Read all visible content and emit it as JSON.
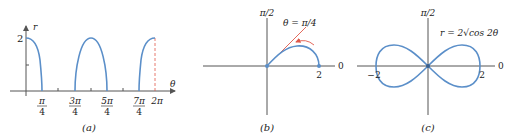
{
  "colors": {
    "curve": "#5b8fc9",
    "axis": "#555555",
    "accent": "#e0584a",
    "text": "#222222"
  },
  "panel_a": {
    "caption": "(a)",
    "y_axis_label": "r",
    "x_axis_label": "θ",
    "y_tick_label": "2",
    "x_ticks": [
      {
        "num": "π",
        "den": "4"
      },
      {
        "num": "3π",
        "den": "4"
      },
      {
        "num": "5π",
        "den": "4"
      },
      {
        "num": "7π",
        "den": "4"
      },
      {
        "num": "2π",
        "den": ""
      }
    ]
  },
  "panel_b": {
    "caption": "(b)",
    "top_label": "π/2",
    "right_label": "0",
    "point_label": "2",
    "line_label": "θ = π/4"
  },
  "panel_c": {
    "caption": "(c)",
    "top_label": "π/2",
    "right_label": "0",
    "left_point_label": "−2",
    "right_point_label": "2",
    "equation_label": "r = 2√cos 2θ"
  }
}
